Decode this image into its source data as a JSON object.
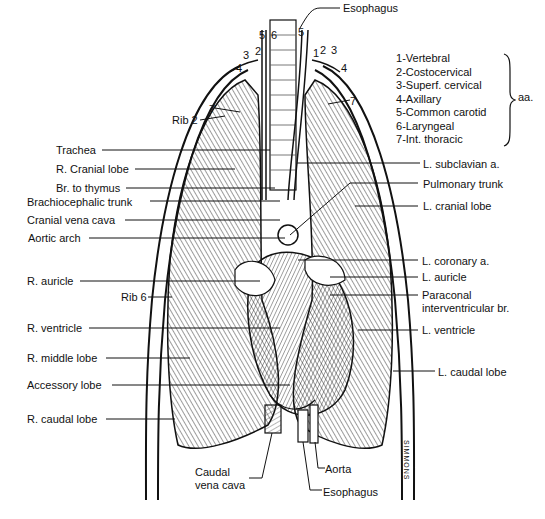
{
  "diagram": {
    "legend": {
      "items": [
        {
          "num": "1",
          "label": "Vertebral"
        },
        {
          "num": "2",
          "label": "Costocervical"
        },
        {
          "num": "3",
          "label": "Superf. cervical"
        },
        {
          "num": "4",
          "label": "Axillary"
        },
        {
          "num": "5",
          "label": "Common carotid"
        },
        {
          "num": "6",
          "label": "Laryngeal"
        },
        {
          "num": "7",
          "label": "Int. thoracic"
        }
      ],
      "suffix": "aa."
    },
    "left_labels": {
      "rib2": "Rib 2",
      "trachea": "Trachea",
      "r_cranial_lobe": "R. Cranial lobe",
      "br_thymus": "Br. to thymus",
      "brachiocephalic": "Brachiocephalic trunk",
      "cranial_vena_cava": "Cranial vena cava",
      "aortic_arch": "Aortic arch",
      "r_auricle": "R. auricle",
      "rib6": "Rib 6",
      "r_ventricle": "R. ventricle",
      "r_middle_lobe": "R. middle lobe",
      "accessory_lobe": "Accessory lobe",
      "r_caudal_lobe": "R. caudal lobe"
    },
    "right_labels": {
      "esophagus_top": "Esophagus",
      "l_subclavian": "L. subclavian a.",
      "pulmonary_trunk": "Pulmonary trunk",
      "l_cranial_lobe": "L. cranial lobe",
      "l_coronary": "L. coronary a.",
      "l_auricle": "L. auricle",
      "paraconal_1": "Paraconal",
      "paraconal_2": "interventricular br.",
      "l_ventricle": "L. ventricle",
      "l_caudal_lobe": "L. caudal lobe"
    },
    "bottom_labels": {
      "caudal_vc_1": "Caudal",
      "caudal_vc_2": "vena cava",
      "aorta": "Aorta",
      "esophagus_bottom": "Esophagus"
    },
    "numbers": {
      "n5a": "5",
      "n6": "6",
      "n5b": "5",
      "n3l": "3",
      "n2l": "2",
      "n4l": "4",
      "n1r": "1",
      "n2r": "2",
      "n3r": "3",
      "n4r": "4",
      "n7l": "7",
      "n7r": "7"
    },
    "signature": "SIMMONS"
  }
}
